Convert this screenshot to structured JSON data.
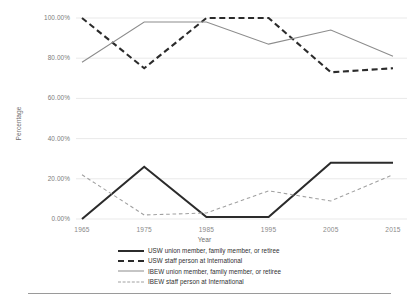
{
  "chart_data": {
    "type": "line",
    "title": "",
    "xlabel": "Year",
    "ylabel": "Percentage",
    "x": [
      1965,
      1975,
      1985,
      1995,
      2005,
      2015
    ],
    "categories": [
      "1965",
      "1975",
      "1985",
      "1995",
      "2005",
      "2015"
    ],
    "ylim": [
      0,
      100
    ],
    "yticks": [
      0,
      20,
      40,
      60,
      80,
      100
    ],
    "ytick_labels": [
      "0.00%",
      "20.00%",
      "40.00%",
      "60.00%",
      "80.00%",
      "100.00%"
    ],
    "grid": true,
    "grid_axis": "y",
    "legend_position": "bottom",
    "series": [
      {
        "name": "USW union member, family member, or retiree",
        "style": "solid",
        "width": "thick",
        "color": "#2b2b2b",
        "values": [
          0,
          26,
          1,
          1,
          28,
          28
        ]
      },
      {
        "name": "USW staff person at International",
        "style": "dashed",
        "width": "thick",
        "color": "#2b2b2b",
        "values": [
          100,
          75,
          100,
          100,
          73,
          75
        ]
      },
      {
        "name": "IBEW union member, family member, or retiree",
        "style": "solid",
        "width": "thin",
        "color": "#8c8c8c",
        "values": [
          78,
          98,
          98,
          87,
          94,
          81
        ]
      },
      {
        "name": "IBEW staff person at International",
        "style": "dashed",
        "width": "thin",
        "color": "#a0a0a0",
        "values": [
          22,
          2,
          3,
          14,
          9,
          22
        ]
      }
    ]
  },
  "legend": {
    "items": [
      {
        "label": "USW union member, family member, or retiree"
      },
      {
        "label": "USW staff person at International"
      },
      {
        "label": "IBEW union member, family member, or retiree"
      },
      {
        "label": "IBEW staff person at International"
      }
    ]
  }
}
